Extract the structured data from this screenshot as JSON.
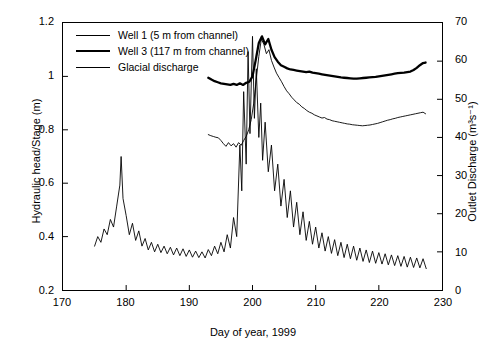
{
  "chart_data": {
    "type": "line",
    "title": "",
    "xlabel": "Day of year, 1999",
    "ylabel": "Hydraulic head/Stage (m)",
    "ylabel_right": "Outlet Discharge (m³s⁻¹)",
    "xlim": [
      170,
      230
    ],
    "ylim": [
      0.2,
      1.2
    ],
    "ylim_right": [
      0,
      70
    ],
    "xticks": [
      170,
      180,
      190,
      200,
      210,
      220,
      230
    ],
    "yticks": [
      0.2,
      0.4,
      0.6,
      0.8,
      1.0,
      1.2
    ],
    "yticks_right": [
      0,
      10,
      20,
      30,
      40,
      50,
      60,
      70
    ],
    "grid": false,
    "legend_position": "top-left",
    "legend": [
      {
        "label": "Well 1 (5 m from channel)",
        "style": "thin",
        "color": "#000000",
        "axis": "left"
      },
      {
        "label": "Well 3 (117 m from channel)",
        "style": "thick",
        "color": "#000000",
        "axis": "left"
      },
      {
        "label": "Glacial discharge",
        "style": "thin",
        "color": "#000000",
        "axis": "right"
      }
    ],
    "series": [
      {
        "name": "Well 1 (5 m from channel)",
        "axis": "left",
        "units": "m",
        "x": [
          193.0,
          193.4,
          193.8,
          194.2,
          194.6,
          195.0,
          195.4,
          195.8,
          196.2,
          196.6,
          197.0,
          197.4,
          197.8,
          198.2,
          198.6,
          199.0,
          199.4,
          199.8,
          200.2,
          200.6,
          201.0,
          201.4,
          201.8,
          202.2,
          202.6,
          203.0,
          203.4,
          203.8,
          204.2,
          204.6,
          205.0,
          205.4,
          205.8,
          206.2,
          206.6,
          207.0,
          207.4,
          207.8,
          208.2,
          208.6,
          209.0,
          209.4,
          209.8,
          210.2,
          210.6,
          211.0,
          211.4,
          211.8,
          212.2,
          212.6,
          213.0,
          213.4,
          213.8,
          214.2,
          214.6,
          215.0,
          215.4,
          215.8,
          216.2,
          216.6,
          217.0,
          217.4,
          217.8,
          218.2,
          218.6,
          219.0,
          219.4,
          219.8,
          220.2,
          220.6,
          221.0,
          221.4,
          221.8,
          222.2,
          222.6,
          223.0,
          223.4,
          223.8,
          224.2,
          224.6,
          225.0,
          225.4,
          225.8,
          226.2,
          226.6,
          227.0,
          227.4
        ],
        "y": [
          0.782,
          0.778,
          0.775,
          0.772,
          0.77,
          0.76,
          0.748,
          0.738,
          0.752,
          0.74,
          0.748,
          0.735,
          0.752,
          0.742,
          0.76,
          0.775,
          0.8,
          0.838,
          0.9,
          0.99,
          1.075,
          1.14,
          1.12,
          1.085,
          1.1,
          1.06,
          1.035,
          1.012,
          0.996,
          0.98,
          0.962,
          0.946,
          0.935,
          0.922,
          0.912,
          0.902,
          0.896,
          0.886,
          0.88,
          0.872,
          0.866,
          0.862,
          0.856,
          0.852,
          0.848,
          0.844,
          0.846,
          0.84,
          0.838,
          0.834,
          0.832,
          0.83,
          0.828,
          0.826,
          0.824,
          0.822,
          0.821,
          0.819,
          0.818,
          0.817,
          0.816,
          0.815,
          0.816,
          0.817,
          0.818,
          0.82,
          0.822,
          0.824,
          0.827,
          0.83,
          0.833,
          0.836,
          0.838,
          0.841,
          0.843,
          0.846,
          0.848,
          0.85,
          0.852,
          0.854,
          0.856,
          0.858,
          0.86,
          0.862,
          0.864,
          0.866,
          0.86
        ]
      },
      {
        "name": "Well 3 (117 m from channel)",
        "axis": "left",
        "units": "m",
        "x": [
          193.0,
          193.5,
          194.0,
          194.5,
          195.0,
          195.5,
          196.0,
          196.5,
          197.0,
          197.5,
          198.0,
          198.5,
          199.0,
          199.5,
          200.0,
          200.5,
          201.0,
          201.5,
          202.0,
          202.5,
          203.0,
          203.5,
          204.0,
          204.5,
          205.0,
          205.5,
          206.0,
          206.5,
          207.0,
          207.5,
          208.0,
          208.5,
          209.0,
          209.5,
          210.0,
          210.5,
          211.0,
          211.5,
          212.0,
          212.5,
          213.0,
          213.5,
          214.0,
          214.5,
          215.0,
          215.5,
          216.0,
          216.5,
          217.0,
          217.5,
          218.0,
          218.5,
          219.0,
          219.5,
          220.0,
          220.5,
          221.0,
          221.5,
          222.0,
          222.5,
          223.0,
          223.5,
          224.0,
          224.5,
          225.0,
          225.5,
          226.0,
          226.5,
          227.0,
          227.4
        ],
        "y": [
          0.995,
          0.988,
          0.982,
          0.978,
          0.974,
          0.972,
          0.97,
          0.968,
          0.972,
          0.968,
          0.974,
          0.968,
          0.976,
          0.98,
          1.0,
          1.06,
          1.125,
          1.15,
          1.12,
          1.14,
          1.1,
          1.072,
          1.055,
          1.042,
          1.036,
          1.03,
          1.026,
          1.024,
          1.022,
          1.02,
          1.018,
          1.016,
          1.018,
          1.014,
          1.012,
          1.01,
          1.008,
          1.006,
          1.004,
          1.002,
          1.0,
          0.998,
          0.996,
          0.995,
          0.994,
          0.993,
          0.992,
          0.992,
          0.993,
          0.994,
          0.995,
          0.996,
          0.997,
          0.998,
          1.0,
          1.002,
          1.004,
          1.006,
          1.008,
          1.01,
          1.012,
          1.013,
          1.014,
          1.016,
          1.018,
          1.024,
          1.032,
          1.042,
          1.05,
          1.052
        ]
      },
      {
        "name": "Glacial discharge",
        "axis": "right",
        "units": "m3 s-1",
        "x": [
          175.0,
          175.5,
          176.0,
          176.5,
          177.0,
          177.5,
          178.0,
          178.5,
          179.0,
          179.2,
          179.5,
          180.0,
          180.5,
          181.0,
          181.5,
          182.0,
          182.5,
          183.0,
          183.5,
          184.0,
          184.5,
          185.0,
          185.5,
          186.0,
          186.5,
          187.0,
          187.5,
          188.0,
          188.5,
          189.0,
          189.5,
          190.0,
          190.5,
          191.0,
          191.5,
          192.0,
          192.5,
          193.0,
          193.5,
          194.0,
          194.5,
          195.0,
          195.5,
          196.0,
          196.5,
          197.0,
          197.5,
          198.0,
          198.3,
          198.6,
          199.0,
          199.3,
          199.6,
          200.0,
          200.3,
          200.6,
          201.0,
          201.3,
          201.6,
          202.0,
          202.5,
          203.0,
          203.5,
          204.0,
          204.5,
          205.0,
          205.5,
          206.0,
          206.5,
          207.0,
          207.5,
          208.0,
          208.5,
          209.0,
          209.5,
          210.0,
          210.5,
          211.0,
          211.5,
          212.0,
          212.5,
          213.0,
          213.5,
          214.0,
          214.5,
          215.0,
          215.5,
          216.0,
          216.5,
          217.0,
          217.5,
          218.0,
          218.5,
          219.0,
          219.5,
          220.0,
          220.5,
          221.0,
          221.5,
          222.0,
          222.5,
          223.0,
          223.5,
          224.0,
          224.5,
          225.0,
          225.5,
          226.0,
          226.5,
          227.0,
          227.5
        ],
        "y": [
          11.5,
          14.0,
          12.5,
          16.0,
          14.5,
          18.5,
          16.5,
          22.0,
          27.5,
          35.0,
          24.0,
          19.5,
          14.5,
          17.5,
          13.0,
          15.5,
          11.5,
          13.5,
          10.5,
          12.5,
          10.0,
          12.0,
          9.8,
          11.5,
          9.5,
          11.2,
          9.2,
          11.0,
          9.0,
          10.8,
          8.8,
          10.5,
          8.6,
          10.2,
          8.5,
          10.0,
          8.4,
          10.6,
          9.0,
          11.5,
          9.5,
          12.5,
          10.0,
          14.5,
          11.0,
          19.0,
          14.0,
          38.0,
          26.0,
          52.0,
          33.0,
          62.5,
          41.0,
          66.5,
          45.0,
          58.0,
          40.0,
          49.0,
          34.0,
          44.0,
          31.0,
          38.0,
          26.0,
          33.0,
          22.0,
          29.0,
          19.0,
          26.0,
          16.5,
          23.0,
          14.5,
          20.5,
          13.0,
          18.0,
          12.0,
          16.5,
          11.0,
          15.0,
          10.2,
          14.0,
          9.6,
          13.2,
          9.0,
          12.5,
          8.5,
          12.0,
          8.2,
          11.5,
          7.8,
          11.0,
          7.5,
          10.5,
          7.2,
          10.2,
          7.0,
          9.8,
          6.8,
          9.5,
          6.6,
          9.2,
          6.4,
          9.0,
          6.2,
          8.8,
          6.0,
          8.6,
          5.9,
          8.4,
          5.8,
          8.2,
          5.6
        ]
      }
    ]
  }
}
